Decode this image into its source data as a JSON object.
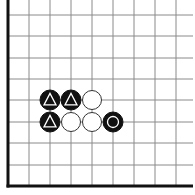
{
  "board": {
    "type": "go-board-fragment",
    "edges": [
      "left",
      "bottom"
    ],
    "grid": {
      "x_lines": [
        8,
        29,
        50,
        71,
        92,
        113,
        134,
        155,
        176
      ],
      "y_lines": [
        15,
        36,
        58,
        79,
        100,
        122,
        143,
        165,
        186
      ],
      "right_extent": 193,
      "top_extent": 15
    },
    "colors": {
      "line": "#8a8a8a",
      "edge": "#111111",
      "black_stone": "#111111",
      "white_stone": "#ffffff",
      "mark_on_black": "#ffffff"
    },
    "stones": [
      {
        "col": 2,
        "row": 4,
        "color": "black",
        "mark": "triangle"
      },
      {
        "col": 3,
        "row": 4,
        "color": "black",
        "mark": "triangle"
      },
      {
        "col": 4,
        "row": 4,
        "color": "white",
        "mark": "none"
      },
      {
        "col": 2,
        "row": 5,
        "color": "black",
        "mark": "triangle"
      },
      {
        "col": 3,
        "row": 5,
        "color": "white",
        "mark": "none"
      },
      {
        "col": 4,
        "row": 5,
        "color": "white",
        "mark": "none"
      },
      {
        "col": 5,
        "row": 5,
        "color": "black",
        "mark": "circle"
      }
    ]
  }
}
